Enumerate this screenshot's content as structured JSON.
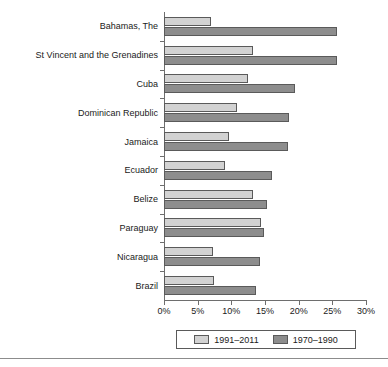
{
  "chart_data": {
    "type": "bar",
    "orientation": "horizontal",
    "title": "",
    "subtitle": "",
    "xlabel": "",
    "ylabel": "",
    "xlim": [
      0,
      30
    ],
    "xtick_labels": [
      "0%",
      "5%",
      "10%",
      "15%",
      "20%",
      "25%",
      "30%"
    ],
    "xtick_values": [
      0,
      5,
      10,
      15,
      20,
      25,
      30
    ],
    "grid": false,
    "legend_position": "bottom",
    "value_unit": "%",
    "categories": [
      "Bahamas, The",
      "St Vincent and the Grenadines",
      "Cuba",
      "Dominican Republic",
      "Jamaica",
      "Ecuador",
      "Belize",
      "Paraguay",
      "Nicaragua",
      "Brazil"
    ],
    "series": [
      {
        "name": "1991–2011",
        "color": "#d2d2d2",
        "values": [
          7.0,
          13.2,
          12.5,
          10.8,
          9.6,
          9.1,
          13.2,
          14.4,
          7.3,
          7.4
        ]
      },
      {
        "name": "1970–1990",
        "color": "#8d8d8d",
        "values": [
          25.7,
          25.7,
          19.5,
          18.5,
          18.4,
          16.0,
          15.3,
          14.9,
          14.2,
          13.7
        ]
      }
    ]
  },
  "legend": {
    "items": [
      {
        "label": "1991–2011",
        "series_index": 0
      },
      {
        "label": "1970–1990",
        "series_index": 1
      }
    ]
  }
}
